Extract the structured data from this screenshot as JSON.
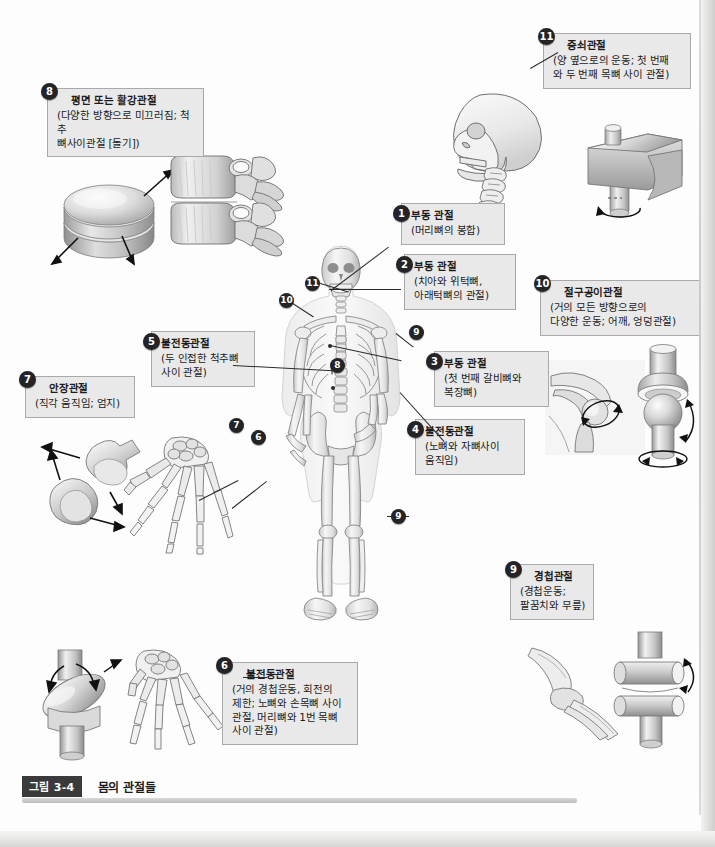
{
  "figure": {
    "tag": "그림 3-4",
    "caption": "몸의 관절들"
  },
  "labels": [
    {
      "num": "1",
      "title": "부동 관절",
      "sub": [
        "(머리뼈의 봉합)"
      ]
    },
    {
      "num": "2",
      "title": "부동 관절",
      "sub": [
        "(치아와 위턱뼈,",
        "아래턱뼈의 관절)"
      ]
    },
    {
      "num": "3",
      "title": "부동 관절",
      "sub": [
        "(첫 번째 갈비뼈와",
        "복장뼈)"
      ]
    },
    {
      "num": "4",
      "title": "불전동관절",
      "sub": [
        "(노뼈와 자뼈사이",
        "움직임)"
      ]
    },
    {
      "num": "5",
      "title": "불전동관절",
      "sub": [
        "(두 인접한 척추뼈",
        "사이 관절)"
      ]
    },
    {
      "num": "6",
      "title": "불전동관절",
      "sub": [
        "(거의 경첩운동, 회전의",
        "제한; 노뼈와 손목뼈 사이",
        "관절, 머리뼈와 1번 목뼈",
        "사이 관절)"
      ]
    },
    {
      "num": "7",
      "title": "안장관절",
      "sub": [
        "(직각 움직임; 엄지)"
      ]
    },
    {
      "num": "8",
      "title": "평면 또는 활강관절",
      "sub": [
        "(다양한 방향으로 미끄러짐; 척추",
        "뼈사이관절 [돌기])"
      ]
    },
    {
      "num": "9",
      "title": "경첩관절",
      "sub": [
        "(경첩운동;",
        "팔꿈치와 무릎)"
      ]
    },
    {
      "num": "10",
      "title": "절구공이관절",
      "sub": [
        "(거의 모든 방향으로의",
        "다양한 운동; 어깨, 엉덩관절)"
      ]
    },
    {
      "num": "11",
      "title": "중쇠관절",
      "sub": [
        "(양 옆으로의 운동; 첫 번째",
        "와 두 번째 목뼈 사이 관절)"
      ]
    }
  ],
  "markers": [
    {
      "num": "1",
      "name": "marker-skull-suture"
    },
    {
      "num": "2",
      "name": "marker-teeth-jaw"
    },
    {
      "num": "3",
      "name": "marker-first-rib-sternum"
    },
    {
      "num": "4",
      "name": "marker-radius-ulna"
    },
    {
      "num": "5",
      "name": "marker-vertebrae"
    },
    {
      "num": "6",
      "name": "marker-wrist"
    },
    {
      "num": "7",
      "name": "marker-thumb"
    },
    {
      "num": "8",
      "name": "marker-spine-facet"
    },
    {
      "num": "9",
      "name": "marker-elbow"
    },
    {
      "num": "9",
      "name": "marker-knee"
    },
    {
      "num": "10",
      "name": "marker-shoulder"
    },
    {
      "num": "11",
      "name": "marker-neck-atlas-axis"
    }
  ],
  "illustrations": [
    {
      "name": "gliding-disc-illustration",
      "alt": "평면관절 원반 모형"
    },
    {
      "name": "vertebrae-illustration",
      "alt": "척추뼈사이관절"
    },
    {
      "name": "skull-neck-illustration",
      "alt": "머리뼈와 목뼈 측면"
    },
    {
      "name": "pivot-joint-illustration",
      "alt": "중쇠관절 모형"
    },
    {
      "name": "shoulder-illustration",
      "alt": "어깨관절"
    },
    {
      "name": "ball-socket-illustration",
      "alt": "절구공이관절 모형"
    },
    {
      "name": "saddle-joint-illustration",
      "alt": "안장관절 모형"
    },
    {
      "name": "hand-skeleton-illustration",
      "alt": "손 뼈대"
    },
    {
      "name": "condyloid-joint-illustration",
      "alt": "불전동관절 모형"
    },
    {
      "name": "hand-skeleton-2-illustration",
      "alt": "손 뼈대"
    },
    {
      "name": "elbow-illustration",
      "alt": "팔꿈치관절"
    },
    {
      "name": "hinge-joint-illustration",
      "alt": "경첩관절 모형"
    },
    {
      "name": "skeleton-illustration",
      "alt": "전신 뼈대"
    }
  ],
  "colors": {
    "label_bg": "#e9e9ea",
    "label_border": "#a9a9ad",
    "badge_bg": "#242428",
    "leader": "#2a2a2a",
    "caption_tag_bg": "#3a3a3a"
  }
}
